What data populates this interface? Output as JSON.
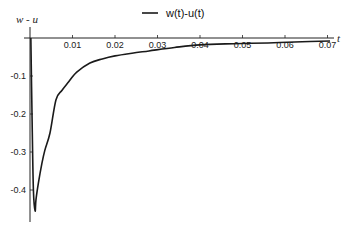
{
  "chart_data": {
    "type": "line",
    "title": "",
    "xlabel": "t",
    "ylabel": "w - u",
    "xlim": [
      0,
      0.072
    ],
    "ylim": [
      -0.47,
      0.03
    ],
    "grid": false,
    "legend_position": "top-center",
    "x_ticks": [
      0.01,
      0.02,
      0.03,
      0.04,
      0.05,
      0.06,
      0.07
    ],
    "x_tick_labels": [
      "0.01",
      "0.02",
      "0.03",
      "0.04",
      "0.05",
      "0.06",
      "0.07"
    ],
    "y_ticks": [
      -0.1,
      -0.2,
      -0.3,
      -0.4
    ],
    "y_tick_labels": [
      "-0.1",
      "-0.2",
      "-0.3",
      "-0.4"
    ],
    "series": [
      {
        "name": "w(t)-u(t)",
        "color": "#1a1a1a",
        "x": [
          0.0002,
          0.0005,
          0.0008,
          0.0012,
          0.0014,
          0.002,
          0.0028,
          0.0035,
          0.0047,
          0.0061,
          0.0075,
          0.0089,
          0.011,
          0.0141,
          0.017,
          0.02,
          0.024,
          0.028,
          0.034,
          0.04,
          0.048,
          0.056,
          0.064,
          0.0706
        ],
        "values": [
          0.0,
          -0.22,
          -0.4,
          -0.455,
          -0.426,
          -0.38,
          -0.33,
          -0.295,
          -0.25,
          -0.163,
          -0.138,
          -0.118,
          -0.09,
          -0.066,
          -0.055,
          -0.047,
          -0.04,
          -0.034,
          -0.025,
          -0.018,
          -0.015,
          -0.013,
          -0.01,
          -0.008
        ]
      }
    ]
  },
  "legend": {
    "label": "w(t)-u(t)"
  },
  "axes": {
    "x_label": "t",
    "y_label": "w - u"
  }
}
